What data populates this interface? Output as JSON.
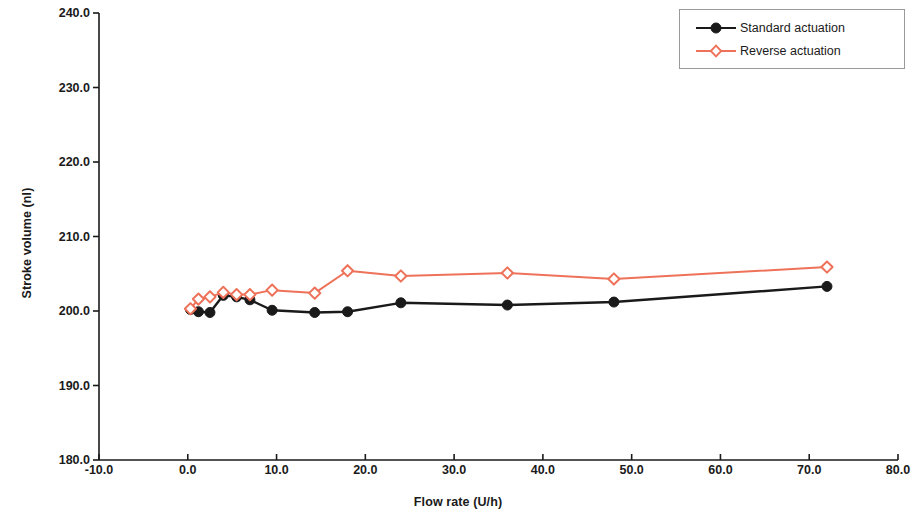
{
  "chart_data": {
    "type": "line",
    "title": "",
    "xlabel": "Flow rate (U/h)",
    "ylabel": "Stroke volume (nl)",
    "xlim": [
      -10.0,
      80.0
    ],
    "ylim": [
      180.0,
      240.0
    ],
    "xticks": [
      "-10.0",
      "0.0",
      "10.0",
      "20.0",
      "30.0",
      "40.0",
      "50.0",
      "60.0",
      "70.0",
      "80.0"
    ],
    "xtick_values": [
      -10,
      0,
      10,
      20,
      30,
      40,
      50,
      60,
      70,
      80
    ],
    "yticks": [
      "240.0",
      "230.0",
      "220.0",
      "210.0",
      "200.0",
      "190.0",
      "180.0"
    ],
    "ytick_values": [
      240,
      230,
      220,
      210,
      200,
      190,
      180
    ],
    "grid": false,
    "legend_position": "top-right",
    "series": [
      {
        "name": "Standard actuation",
        "color": "#1a1a1a",
        "marker": "circle",
        "x": [
          0.3,
          1.2,
          2.5,
          4.0,
          5.5,
          7.0,
          9.5,
          14.3,
          18.0,
          24.0,
          36.0,
          48.0,
          72.0
        ],
        "y": [
          200.2,
          199.9,
          199.8,
          202.1,
          201.9,
          201.5,
          200.1,
          199.8,
          199.9,
          201.1,
          200.8,
          201.2,
          203.3
        ]
      },
      {
        "name": "Reverse actuation",
        "color": "#ee7259",
        "marker": "diamond",
        "x": [
          0.3,
          1.2,
          2.5,
          4.0,
          5.5,
          7.0,
          9.5,
          14.3,
          18.0,
          24.0,
          36.0,
          48.0,
          72.0
        ],
        "y": [
          200.3,
          201.6,
          201.9,
          202.5,
          202.2,
          202.2,
          202.8,
          202.4,
          205.4,
          204.7,
          205.1,
          204.3,
          205.9
        ]
      }
    ]
  },
  "legend": {
    "items": [
      {
        "label": "Standard actuation"
      },
      {
        "label": "Reverse actuation"
      }
    ]
  },
  "axes": {
    "x_title": "Flow rate (U/h)",
    "y_title": "Stroke volume (nl)"
  },
  "colors": {
    "standard": "#1a1a1a",
    "reverse": "#ee7259",
    "axis": "#1a1a1a",
    "legend_border": "#9a9a9a",
    "background": "#ffffff"
  }
}
